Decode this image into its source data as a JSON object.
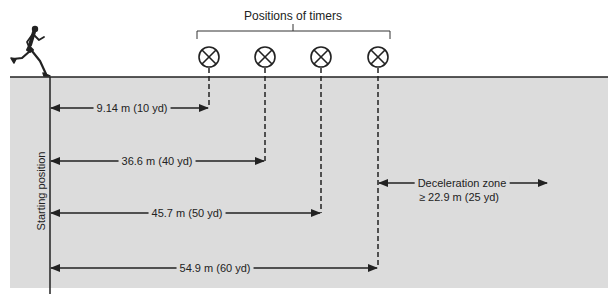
{
  "diagram": {
    "title": "Positions of timers",
    "starting_label": "Starting position",
    "colors": {
      "field": "#dcdcdc",
      "line": "#222222",
      "background": "#ffffff"
    },
    "timers": [
      {
        "id": 1,
        "x": 209
      },
      {
        "id": 2,
        "x": 265
      },
      {
        "id": 3,
        "x": 321
      },
      {
        "id": 4,
        "x": 378
      }
    ],
    "distances": [
      {
        "label": "9.14 m (10 yd)",
        "meters": 9.14,
        "yards": 10
      },
      {
        "label": "36.6 m (40 yd)",
        "meters": 36.6,
        "yards": 40
      },
      {
        "label": "45.7 m (50 yd)",
        "meters": 45.7,
        "yards": 50
      },
      {
        "label": "54.9 m (60 yd)",
        "meters": 54.9,
        "yards": 60
      }
    ],
    "deceleration": {
      "line1": "Deceleration zone",
      "line2": "≥ 22.9 m (25 yd)"
    },
    "icons": {
      "runner": "runner-icon",
      "timer": "timer-circle-x-icon"
    }
  }
}
